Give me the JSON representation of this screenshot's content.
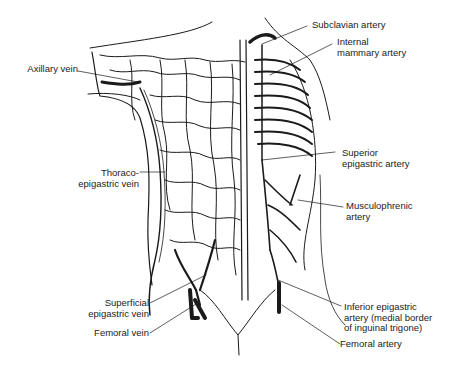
{
  "diagram": {
    "labels_left": [
      {
        "id": "axillary-vein",
        "lines": [
          "Axillary vein"
        ]
      },
      {
        "id": "thoracoepigastric-vein",
        "lines": [
          "Thoraco-",
          "epigastric vein"
        ]
      },
      {
        "id": "superficial-epigastric-vein",
        "lines": [
          "Superficial",
          "epigastric vein"
        ]
      },
      {
        "id": "femoral-vein",
        "lines": [
          "Femoral vein"
        ]
      }
    ],
    "labels_right": [
      {
        "id": "subclavian-artery",
        "lines": [
          "Subclavian artery"
        ]
      },
      {
        "id": "internal-mammary-artery",
        "lines": [
          "Internal",
          "mammary artery"
        ]
      },
      {
        "id": "superior-epigastric-artery",
        "lines": [
          "Superior",
          "epigastric artery"
        ]
      },
      {
        "id": "musculophrenic-artery",
        "lines": [
          "Musculophrenic",
          "artery"
        ]
      },
      {
        "id": "inferior-epigastric-artery",
        "lines": [
          "Inferior epigastric",
          "artery (medial border",
          "of inguinal trigone)"
        ]
      },
      {
        "id": "femoral-artery",
        "lines": [
          "Femoral artery"
        ]
      }
    ],
    "colors": {
      "ink": "#1a1a1a",
      "background": "#ffffff"
    }
  }
}
